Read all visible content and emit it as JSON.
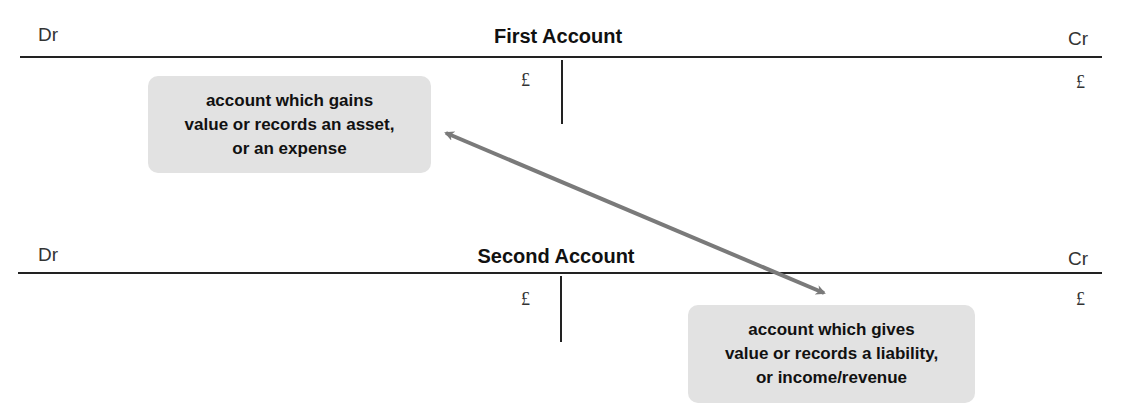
{
  "first_account": {
    "dr_label": "Dr",
    "title": "First Account",
    "cr_label": "Cr",
    "debit_currency": "£",
    "credit_currency": "£"
  },
  "second_account": {
    "dr_label": "Dr",
    "title": "Second Account",
    "cr_label": "Cr",
    "debit_currency": "£",
    "credit_currency": "£"
  },
  "notes": {
    "debit_note": {
      "line1": "account which gains",
      "line2": "value or records an asset,",
      "line3": "or an expense"
    },
    "credit_note": {
      "line1": "account which gives",
      "line2": "value or records a liability,",
      "line3": "or income/revenue"
    }
  },
  "colors": {
    "note_background": "#e2e2e2",
    "arrow": "#7a7a7a",
    "rule": "#222222"
  },
  "arrow": {
    "type": "double-headed",
    "from": "debit_note",
    "to": "credit_note"
  }
}
